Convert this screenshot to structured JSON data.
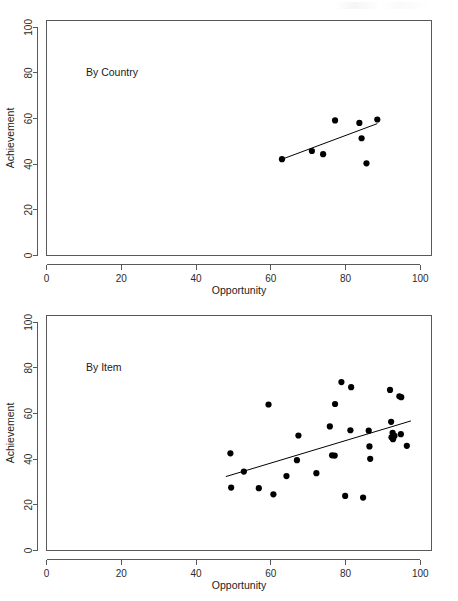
{
  "figure": {
    "panels": [
      {
        "id": "by-country",
        "note": "By Country",
        "xlabel": "Opportunity",
        "ylabel": "Achievement"
      },
      {
        "id": "by-item",
        "note": "By Item",
        "xlabel": "Opportunity",
        "ylabel": "Achievement"
      }
    ],
    "x_ticks": [
      "0",
      "20",
      "40",
      "60",
      "80",
      "100"
    ],
    "y_ticks": [
      "0",
      "20",
      "40",
      "60",
      "80",
      "100"
    ]
  },
  "chart_data": [
    {
      "type": "scatter",
      "title": "By Country",
      "xlabel": "Opportunity",
      "ylabel": "Achievement",
      "xlim": [
        0,
        103
      ],
      "ylim": [
        0,
        103
      ],
      "xticks": [
        0,
        20,
        40,
        60,
        80,
        100
      ],
      "yticks": [
        0,
        20,
        40,
        60,
        80,
        100
      ],
      "grid": false,
      "legend": false,
      "annotations": [
        {
          "text": "By Country",
          "x": 12,
          "y": 80
        }
      ],
      "points": [
        {
          "x": 63.0,
          "y": 42.2
        },
        {
          "x": 71.0,
          "y": 45.8
        },
        {
          "x": 74.0,
          "y": 44.4
        },
        {
          "x": 77.2,
          "y": 59.2
        },
        {
          "x": 83.7,
          "y": 58.1
        },
        {
          "x": 84.3,
          "y": 51.4
        },
        {
          "x": 85.6,
          "y": 40.4
        },
        {
          "x": 88.5,
          "y": 59.6
        }
      ],
      "fit_line": {
        "x0": 63.0,
        "y0": 42.2,
        "x1": 88.5,
        "y1": 57.8
      }
    },
    {
      "type": "scatter",
      "title": "By Item",
      "xlabel": "Opportunity",
      "ylabel": "Achievement",
      "xlim": [
        0,
        103
      ],
      "ylim": [
        0,
        103
      ],
      "xticks": [
        0,
        20,
        40,
        60,
        80,
        100
      ],
      "yticks": [
        0,
        20,
        40,
        60,
        80,
        100
      ],
      "grid": false,
      "legend": false,
      "annotations": [
        {
          "text": "By Item",
          "x": 12,
          "y": 80
        }
      ],
      "points": [
        {
          "x": 49.2,
          "y": 42.6
        },
        {
          "x": 49.4,
          "y": 27.6
        },
        {
          "x": 52.8,
          "y": 34.6
        },
        {
          "x": 56.8,
          "y": 27.3
        },
        {
          "x": 59.4,
          "y": 64.0
        },
        {
          "x": 60.7,
          "y": 24.6
        },
        {
          "x": 64.2,
          "y": 32.6
        },
        {
          "x": 67.0,
          "y": 39.6
        },
        {
          "x": 67.4,
          "y": 50.4
        },
        {
          "x": 72.2,
          "y": 33.9
        },
        {
          "x": 75.8,
          "y": 54.4
        },
        {
          "x": 76.4,
          "y": 41.7
        },
        {
          "x": 77.1,
          "y": 41.6
        },
        {
          "x": 77.2,
          "y": 64.2
        },
        {
          "x": 78.9,
          "y": 73.8
        },
        {
          "x": 79.9,
          "y": 23.9
        },
        {
          "x": 81.3,
          "y": 52.7
        },
        {
          "x": 81.5,
          "y": 71.6
        },
        {
          "x": 84.7,
          "y": 23.2
        },
        {
          "x": 86.2,
          "y": 52.5
        },
        {
          "x": 86.4,
          "y": 45.6
        },
        {
          "x": 86.6,
          "y": 40.2
        },
        {
          "x": 91.9,
          "y": 70.4
        },
        {
          "x": 92.2,
          "y": 56.4
        },
        {
          "x": 92.3,
          "y": 49.6
        },
        {
          "x": 92.6,
          "y": 51.6
        },
        {
          "x": 92.7,
          "y": 48.8
        },
        {
          "x": 93.1,
          "y": 50.2
        },
        {
          "x": 94.4,
          "y": 67.6
        },
        {
          "x": 94.9,
          "y": 67.2
        },
        {
          "x": 94.8,
          "y": 51.0
        },
        {
          "x": 96.4,
          "y": 45.9
        }
      ],
      "fit_line": {
        "x0": 48.0,
        "y0": 32.4,
        "x1": 97.5,
        "y1": 56.8
      }
    }
  ]
}
